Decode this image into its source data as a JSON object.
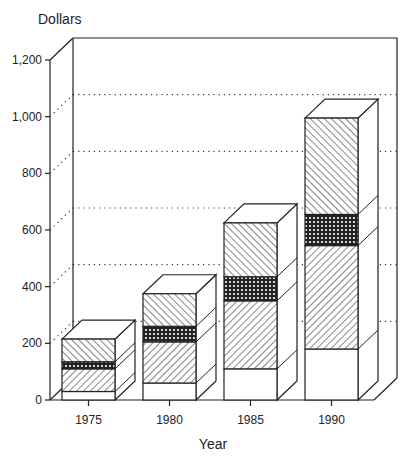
{
  "chart_data": {
    "type": "bar",
    "stacked": true,
    "style": "3d",
    "title": "",
    "ylabel": "Dollars",
    "xlabel": "Year",
    "categories": [
      "1975",
      "1980",
      "1985",
      "1990"
    ],
    "yticks": [
      0,
      200,
      400,
      600,
      800,
      1000,
      1200
    ],
    "ytick_labels": [
      "0",
      "200",
      "400",
      "600",
      "800",
      "1,000",
      "1,200"
    ],
    "ylim": [
      0,
      1200
    ],
    "grid": "dotted horizontal on back wall",
    "legend": "none",
    "series": [
      {
        "name": "Segment 1 (white, bottom)",
        "pattern": "none",
        "values": [
          30,
          60,
          110,
          180
        ]
      },
      {
        "name": "Segment 2 (forward-diagonal hatch)",
        "pattern": "diagonal-up",
        "values": [
          80,
          145,
          240,
          365
        ]
      },
      {
        "name": "Segment 3 (cross-hatch)",
        "pattern": "crosshatch",
        "values": [
          25,
          55,
          85,
          110
        ]
      },
      {
        "name": "Segment 4 (back-diagonal hatch, top)",
        "pattern": "diagonal-down",
        "values": [
          80,
          115,
          190,
          340
        ]
      }
    ],
    "totals": [
      215,
      375,
      625,
      995
    ]
  },
  "labels": {
    "ylabel": "Dollars",
    "xlabel": "Year"
  }
}
